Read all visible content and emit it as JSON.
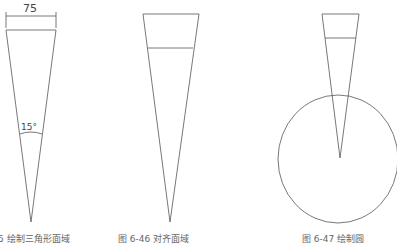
{
  "figures": [
    {
      "id": "fig-left",
      "dimension_label": "75",
      "angle_label": "15°",
      "caption": "5  绘制三角形面域"
    },
    {
      "id": "fig-middle",
      "caption": "图 6-46  对齐面域"
    },
    {
      "id": "fig-right",
      "caption": "图 6-47  绘制圆"
    }
  ],
  "colors": {
    "line": "#555555",
    "caption": "#666666"
  }
}
